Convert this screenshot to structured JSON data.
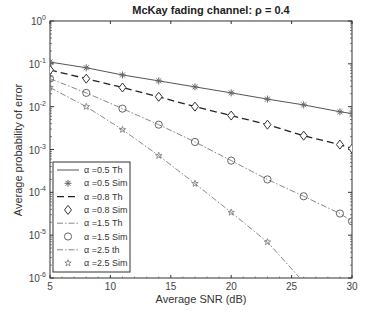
{
  "chart_data": {
    "type": "line",
    "title": "McKay fading channel:  ρ = 0.4",
    "xlabel": "Average SNR (dB)",
    "ylabel": "Average probability of error",
    "xlim": [
      5,
      30
    ],
    "ylim": [
      1e-06,
      1
    ],
    "yscale": "log",
    "x_ticks": [
      "5",
      "10",
      "15",
      "20",
      "25",
      "30"
    ],
    "y_ticks": [
      "10^0",
      "10^-1",
      "10^-2",
      "10^-3",
      "10^-4",
      "10^-5",
      "10^-6"
    ],
    "grid": false,
    "legend_position": "lower left",
    "x": [
      5,
      8,
      11,
      14,
      17,
      20,
      23,
      26,
      29,
      30
    ],
    "series": [
      {
        "name": "α =0.5  Th",
        "style": "solid",
        "marker": "none",
        "values": [
          0.11,
          0.081,
          0.055,
          0.04,
          0.029,
          0.021,
          0.015,
          0.011,
          0.0076,
          0.0069
        ]
      },
      {
        "name": "α =0.5  Sim",
        "style": "none",
        "marker": "asterisk",
        "values": [
          0.11,
          0.081,
          0.055,
          0.04,
          0.029,
          0.021,
          0.015,
          0.011,
          0.0076,
          0.0069
        ]
      },
      {
        "name": "α =0.8  Th",
        "style": "dashed",
        "marker": "none",
        "values": [
          0.072,
          0.045,
          0.028,
          0.017,
          0.01,
          0.0062,
          0.0038,
          0.0021,
          0.0013,
          0.00105
        ]
      },
      {
        "name": "α =0.8  Sim",
        "style": "none",
        "marker": "diamond",
        "values": [
          0.072,
          0.045,
          0.028,
          0.017,
          0.01,
          0.0062,
          0.0038,
          0.0021,
          0.0013,
          0.00105
        ]
      },
      {
        "name": "α =1.5  Th",
        "style": "dashdot",
        "marker": "none",
        "values": [
          0.045,
          0.021,
          0.009,
          0.0038,
          0.0015,
          0.00055,
          0.0002,
          8.1e-05,
          3.2e-05,
          2.1e-05
        ]
      },
      {
        "name": "α =1.5  Sim",
        "style": "none",
        "marker": "circle",
        "values": [
          0.045,
          0.021,
          0.009,
          0.0038,
          0.0015,
          0.00055,
          0.0002,
          8.1e-05,
          3.2e-05,
          2.1e-05
        ]
      },
      {
        "name": "α =2.5  th",
        "style": "dashdot",
        "marker": "none",
        "values": [
          0.028,
          0.01,
          0.0029,
          0.00072,
          0.00016,
          3.4e-05,
          6.9e-06,
          8e-07,
          null,
          null
        ]
      },
      {
        "name": "α =2.5  Sim",
        "style": "none",
        "marker": "star",
        "values": [
          0.028,
          0.01,
          0.0029,
          0.00072,
          0.00016,
          3.4e-05,
          6.9e-06,
          null,
          null,
          null
        ]
      }
    ]
  },
  "colors": {
    "axis": "#333333",
    "line": "#555555",
    "dark_line": "#222222",
    "light_line": "#888888"
  }
}
